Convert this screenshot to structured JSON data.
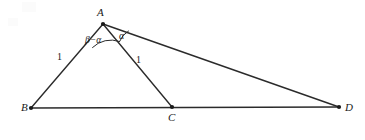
{
  "figure": {
    "type": "geometry-diagram",
    "stroke_color": "#2b2b2b",
    "background_color": "#ffffff",
    "points": {
      "A": {
        "label": "A",
        "x": 103,
        "y": 24
      },
      "B": {
        "label": "B",
        "x": 31,
        "y": 108
      },
      "C": {
        "label": "C",
        "x": 172,
        "y": 107
      },
      "D": {
        "label": "D",
        "x": 339,
        "y": 107
      }
    },
    "segments": [
      {
        "name": "AB",
        "from": "A",
        "to": "B"
      },
      {
        "name": "AC",
        "from": "A",
        "to": "C"
      },
      {
        "name": "AD",
        "from": "A",
        "to": "D"
      },
      {
        "name": "BD",
        "from": "B",
        "to": "D"
      }
    ],
    "length_labels": [
      {
        "name": "AB",
        "text": "1"
      },
      {
        "name": "AC",
        "text": "1"
      }
    ],
    "angle_labels": [
      {
        "name": "BAC",
        "text": "β−α"
      },
      {
        "name": "CAD",
        "text": "α"
      }
    ]
  }
}
